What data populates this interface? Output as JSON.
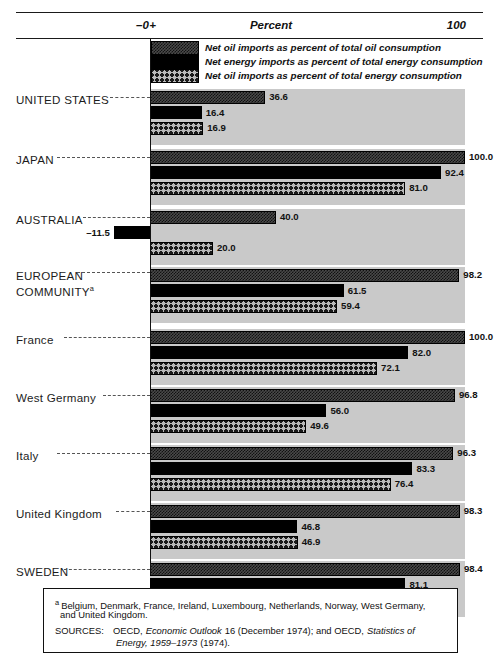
{
  "axis": {
    "zero_label": "–0+",
    "title": "Percent",
    "max_label": "100",
    "min_value": -20,
    "max_value": 100,
    "zero_x_px": 150,
    "px_per_percent": 3.15
  },
  "legend": {
    "items": [
      {
        "key": "oil_of_oil",
        "pattern": "dark-fine-hatch",
        "label": "Net oil imports as percent of total oil consumption"
      },
      {
        "key": "energy",
        "pattern": "solid-black",
        "label": "Net energy imports as percent of total energy consumption"
      },
      {
        "key": "oil_of_energy",
        "pattern": "coarse-crosshatch",
        "label": "Net oil imports as percent of total energy consumption"
      }
    ]
  },
  "chart_data": {
    "type": "bar",
    "orientation": "horizontal",
    "title": "Percent",
    "xlabel": "Percent",
    "ylabel": "",
    "xlim": [
      -20,
      100
    ],
    "grid": false,
    "legend_position": "top-inside",
    "categories": [
      "UNITED STATES",
      "JAPAN",
      "AUSTRALIA",
      "EUROPEAN COMMUNITY",
      "France",
      "West Germany",
      "Italy",
      "United Kingdom",
      "SWEDEN"
    ],
    "series": [
      {
        "name": "Net oil imports as percent of total oil consumption",
        "pattern": "dark-fine-hatch",
        "values": [
          36.6,
          100.0,
          40.0,
          98.2,
          100.0,
          96.8,
          96.3,
          98.3,
          98.4
        ]
      },
      {
        "name": "Net energy imports as percent of total energy consumption",
        "pattern": "solid-black",
        "values": [
          16.4,
          92.4,
          -11.5,
          61.5,
          82.0,
          56.0,
          83.3,
          46.8,
          81.1
        ]
      },
      {
        "name": "Net oil imports as percent of total energy consumption",
        "pattern": "coarse-crosshatch",
        "values": [
          16.9,
          81.0,
          20.0,
          59.4,
          72.1,
          49.6,
          76.4,
          46.9,
          76.7
        ]
      }
    ]
  },
  "rows": [
    {
      "label": "UNITED STATES",
      "label_lines": [
        "UNITED STATES"
      ],
      "footnote_marker": "",
      "bars": [
        {
          "value": 36.6,
          "text": "36.6",
          "series": "oil_of_oil"
        },
        {
          "value": 16.4,
          "text": "16.4",
          "series": "energy"
        },
        {
          "value": 16.9,
          "text": "16.9",
          "series": "oil_of_energy"
        }
      ]
    },
    {
      "label": "JAPAN",
      "label_lines": [
        "JAPAN"
      ],
      "footnote_marker": "",
      "bars": [
        {
          "value": 100.0,
          "text": "100.0",
          "series": "oil_of_oil"
        },
        {
          "value": 92.4,
          "text": "92.4",
          "series": "energy"
        },
        {
          "value": 81.0,
          "text": "81.0",
          "series": "oil_of_energy"
        }
      ]
    },
    {
      "label": "AUSTRALIA",
      "label_lines": [
        "AUSTRALIA"
      ],
      "footnote_marker": "",
      "bars": [
        {
          "value": 40.0,
          "text": "40.0",
          "series": "oil_of_oil"
        },
        {
          "value": -11.5,
          "text": "–11.5",
          "series": "energy"
        },
        {
          "value": 20.0,
          "text": "20.0",
          "series": "oil_of_energy"
        }
      ]
    },
    {
      "label": "EUROPEAN COMMUNITY",
      "label_lines": [
        "EUROPEAN",
        "COMMUNITY"
      ],
      "footnote_marker": "a",
      "bars": [
        {
          "value": 98.2,
          "text": "98.2",
          "series": "oil_of_oil"
        },
        {
          "value": 61.5,
          "text": "61.5",
          "series": "energy"
        },
        {
          "value": 59.4,
          "text": "59.4",
          "series": "oil_of_energy"
        }
      ]
    },
    {
      "label": "France",
      "label_lines": [
        "France"
      ],
      "footnote_marker": "",
      "bars": [
        {
          "value": 100.0,
          "text": "100.0",
          "series": "oil_of_oil"
        },
        {
          "value": 82.0,
          "text": "82.0",
          "series": "energy"
        },
        {
          "value": 72.1,
          "text": "72.1",
          "series": "oil_of_energy"
        }
      ]
    },
    {
      "label": "West Germany",
      "label_lines": [
        "West Germany"
      ],
      "footnote_marker": "",
      "bars": [
        {
          "value": 96.8,
          "text": "96.8",
          "series": "oil_of_oil"
        },
        {
          "value": 56.0,
          "text": "56.0",
          "series": "energy"
        },
        {
          "value": 49.6,
          "text": "49.6",
          "series": "oil_of_energy"
        }
      ]
    },
    {
      "label": "Italy",
      "label_lines": [
        "Italy"
      ],
      "footnote_marker": "",
      "bars": [
        {
          "value": 96.3,
          "text": "96.3",
          "series": "oil_of_oil"
        },
        {
          "value": 83.3,
          "text": "83.3",
          "series": "energy"
        },
        {
          "value": 76.4,
          "text": "76.4",
          "series": "oil_of_energy"
        }
      ]
    },
    {
      "label": "United Kingdom",
      "label_lines": [
        "United Kingdom"
      ],
      "footnote_marker": "",
      "bars": [
        {
          "value": 98.3,
          "text": "98.3",
          "series": "oil_of_oil"
        },
        {
          "value": 46.8,
          "text": "46.8",
          "series": "energy"
        },
        {
          "value": 46.9,
          "text": "46.9",
          "series": "oil_of_energy"
        }
      ]
    },
    {
      "label": "SWEDEN",
      "label_lines": [
        "SWEDEN"
      ],
      "footnote_marker": "",
      "bars": [
        {
          "value": 98.4,
          "text": "98.4",
          "series": "oil_of_oil"
        },
        {
          "value": 81.1,
          "text": "81.1",
          "series": "energy"
        },
        {
          "value": 76.7,
          "text": "76.7",
          "series": "oil_of_energy"
        }
      ]
    }
  ],
  "footnote": {
    "marker": "a",
    "text_line1": "Belgium, Denmark, France, Ireland, Luxembourg, Netherlands, Norway, West Germany,",
    "text_line2": "and United Kingdom.",
    "sources_label": "SOURCES:",
    "sources_seg1": "OECD,",
    "sources_seg2_italic": "Economic Outlook",
    "sources_seg3": "16 (December 1974); and OECD,",
    "sources_seg4_italic": "Statistics of",
    "sources_seg5_italic": "Energy, 1959–1973",
    "sources_seg6": "(1974)."
  },
  "colors": {
    "background": "#ffffff",
    "row_band": "#c9c9c9",
    "ink": "#111111",
    "bar_dark": "#4a4a4a",
    "bar_black": "#000000",
    "bar_light": "#b9b9b9"
  }
}
